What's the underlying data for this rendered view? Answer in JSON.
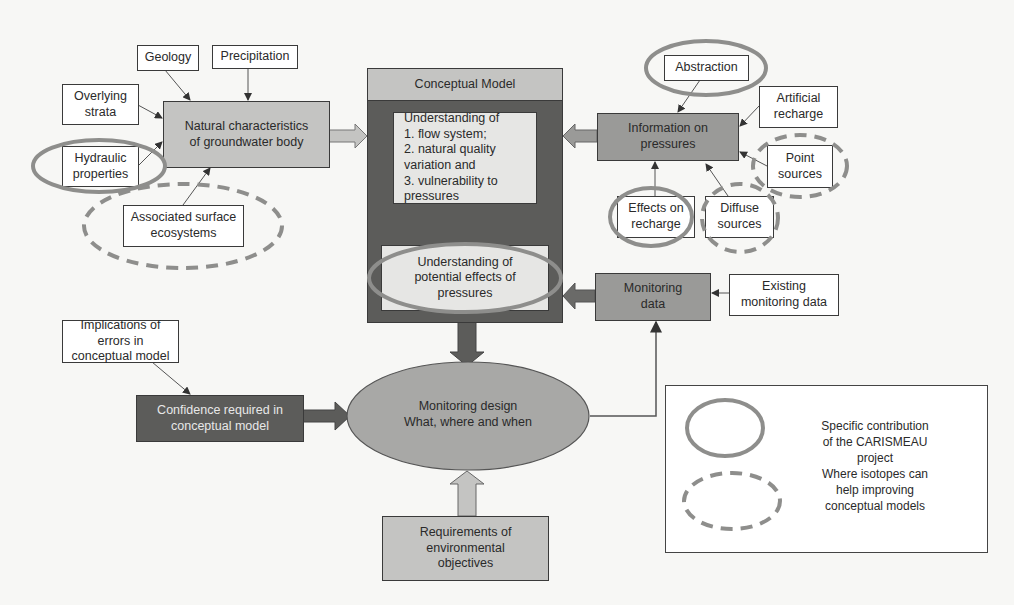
{
  "diagram": {
    "inputs_natural": {
      "geology": "Geology",
      "precipitation": "Precipitation",
      "overlying_strata": "Overlying strata",
      "hydraulic_properties": "Hydraulic properties",
      "associated_surface_ecosystems": "Associated surface ecosystems"
    },
    "natural_characteristics": "Natural characteristics of groundwater body",
    "conceptual_model": {
      "title": "Conceptual Model",
      "understanding_heading": "Understanding of",
      "understanding_items": [
        "1. flow system;",
        "2. natural quality variation and",
        "3. vulnerability to pressures"
      ],
      "potential_effects": "Understanding of potential effects of pressures"
    },
    "pressures": {
      "information": "Information on pressures",
      "abstraction": "Abstraction",
      "artificial_recharge": "Artificial recharge",
      "point_sources": "Point sources",
      "effects_on_recharge": "Effects on recharge",
      "diffuse_sources": "Diffuse sources"
    },
    "monitoring": {
      "monitoring_data": "Monitoring data",
      "existing_monitoring_data": "Existing monitoring data",
      "design_line1": "Monitoring design",
      "design_line2": "What, where and when"
    },
    "confidence": {
      "implications": "Implications of errors in conceptual model",
      "confidence_required": "Confidence required in conceptual model"
    },
    "requirements": "Requirements of environmental objectives",
    "legend": {
      "solid_label": "Specific contribution of the CARISMEAU project",
      "dashed_label": "Where isotopes can help improving conceptual models"
    },
    "colors": {
      "highlight_ellipse": "#8e8e8c",
      "dark_box": "#5c5c5a",
      "mid_box": "#9a9a98",
      "light_box": "#c4c4c2"
    }
  }
}
